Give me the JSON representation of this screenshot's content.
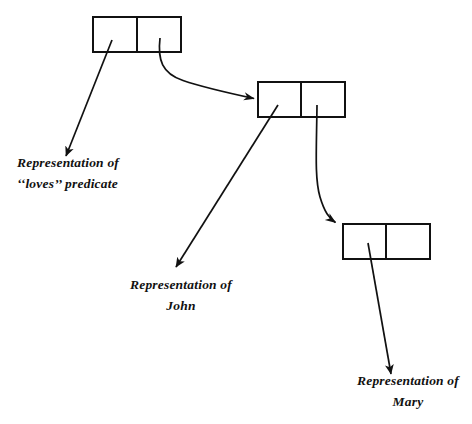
{
  "figure": {
    "background_color": "#ffffff",
    "stroke_color": "#111111",
    "canvas": {
      "width": 472,
      "height": 424
    }
  },
  "nodes": [
    {
      "id": "node-loves",
      "name": "loves-node",
      "x": 93,
      "y": 17,
      "width": 88,
      "height": 35,
      "divider_x": 137,
      "left_cell_label": "",
      "right_cell_label": ""
    },
    {
      "id": "node-john",
      "name": "john-node",
      "x": 258,
      "y": 82,
      "width": 87,
      "height": 35,
      "divider_x": 301,
      "left_cell_label": "",
      "right_cell_label": ""
    },
    {
      "id": "node-mary",
      "name": "mary-node",
      "x": 343,
      "y": 224,
      "width": 87,
      "height": 35,
      "divider_x": 386,
      "left_cell_label": "",
      "right_cell_label": ""
    }
  ],
  "connectors": [
    {
      "id": "connector-loves-to-caption",
      "name": "loves-pointer-arrow",
      "kind": "straight",
      "from": [
        112,
        40
      ],
      "to": [
        66,
        156
      ]
    },
    {
      "id": "connector-loves-to-john-node",
      "name": "loves-to-john-node-arrow",
      "kind": "curved",
      "from": [
        160,
        38
      ],
      "to": [
        256,
        99
      ]
    },
    {
      "id": "connector-john-to-caption",
      "name": "john-pointer-arrow",
      "kind": "straight",
      "from": [
        278,
        105
      ],
      "to": [
        176,
        267
      ]
    },
    {
      "id": "connector-john-to-mary-node",
      "name": "john-to-mary-node-arrow",
      "kind": "curved",
      "from": [
        317,
        105
      ],
      "to": [
        338,
        224
      ]
    },
    {
      "id": "connector-mary-to-caption",
      "name": "mary-pointer-arrow",
      "kind": "straight",
      "from": [
        368,
        243
      ],
      "to": [
        391,
        374
      ]
    }
  ],
  "captions": {
    "loves": {
      "name": "loves-caption",
      "line1": "Representation of",
      "line2": "‘‘loves’’ predicate",
      "align": "left"
    },
    "john": {
      "name": "john-caption",
      "line1": "Representation of",
      "line2": "John",
      "align": "center"
    },
    "mary": {
      "name": "mary-caption",
      "line1": "Representation of",
      "line2": "Mary",
      "align": "center"
    }
  }
}
